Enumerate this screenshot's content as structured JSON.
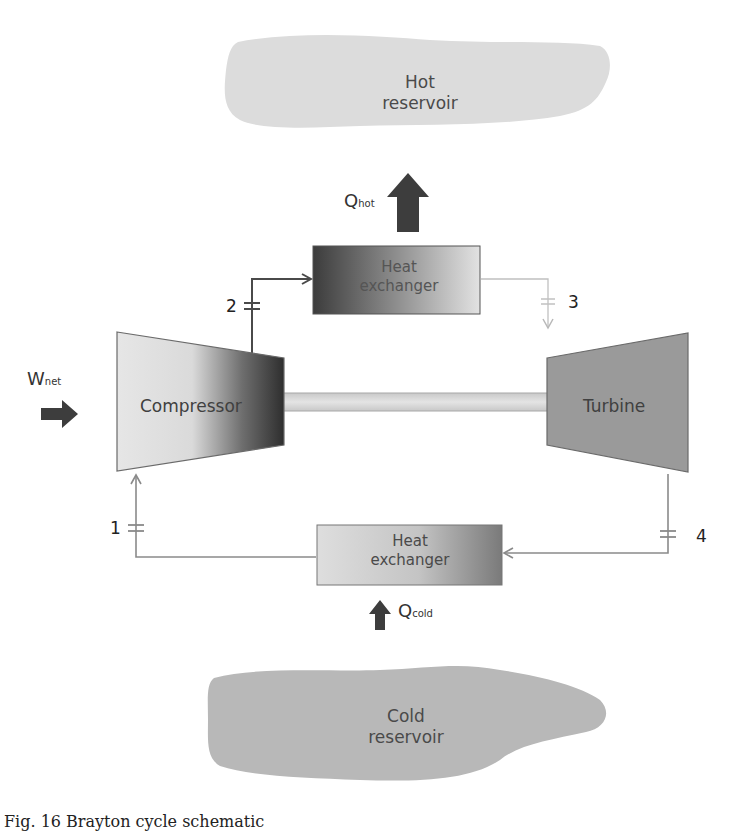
{
  "diagram": {
    "type": "Brayton cycle schematic",
    "reservoirs": {
      "hot": {
        "line1": "Hot",
        "line2": "reservoir",
        "fill": "#dcdcdc"
      },
      "cold": {
        "line1": "Cold",
        "line2": "reservoir",
        "fill": "#b5b5b5"
      }
    },
    "components": {
      "hot_heat_exchanger": {
        "line1": "Heat",
        "line2": "exchanger"
      },
      "cold_heat_exchanger": {
        "line1": "Heat",
        "line2": "exchanger"
      },
      "compressor": {
        "label": "Compressor"
      },
      "turbine": {
        "label": "Turbine",
        "fill": "#9a9a9a"
      },
      "shaft": {
        "fill": "#d6d6d6"
      }
    },
    "flows": {
      "q_hot": {
        "main": "Q",
        "sub": "hot",
        "direction": "up"
      },
      "q_cold": {
        "main": "Q",
        "sub": "cold",
        "direction": "up"
      },
      "w_net": {
        "main": "W",
        "sub": "net",
        "direction": "right"
      }
    },
    "state_points": [
      {
        "id": "1",
        "label": "1"
      },
      {
        "id": "2",
        "label": "2"
      },
      {
        "id": "3",
        "label": "3"
      },
      {
        "id": "4",
        "label": "4"
      }
    ],
    "colors": {
      "arrow_fill": "#3d3d3d",
      "pipe_dark": "#4a4a4a",
      "pipe_light": "#b8b8b8",
      "pipe_medium": "#8a8a8a"
    }
  },
  "caption": {
    "text": "Fig. 16  Brayton cycle schematic"
  }
}
